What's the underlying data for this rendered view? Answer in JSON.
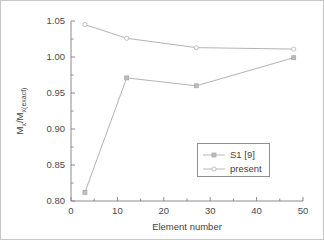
{
  "chart_data": {
    "type": "line",
    "title": "",
    "xlabel": "Element number",
    "ylabel": "Mx/Mx(exact)",
    "ylabel_parts": {
      "m1": "M",
      "sub1": "x",
      "slash": "/M",
      "sub2": "x(exact)"
    },
    "xlim": [
      0,
      50
    ],
    "ylim": [
      0.8,
      1.05
    ],
    "grid": false,
    "legend_position": "center-right",
    "x_ticks": [
      0,
      10,
      20,
      30,
      40,
      50
    ],
    "x_tick_labels": [
      "0",
      "10",
      "20",
      "30",
      "40",
      "50"
    ],
    "x_minor_ticks": [
      5,
      15,
      25,
      35,
      45
    ],
    "y_ticks": [
      0.8,
      0.85,
      0.9,
      0.95,
      1.0,
      1.05
    ],
    "y_tick_labels": [
      "0.80",
      "0.85",
      "0.90",
      "0.95",
      "1.00",
      "1.05"
    ],
    "y_minor_ticks": [
      0.825,
      0.875,
      0.925,
      0.975,
      1.025
    ],
    "series": [
      {
        "name": "S1 [9]",
        "marker": "filled-square",
        "color": "#b4b4b4",
        "x": [
          3,
          12,
          27,
          48
        ],
        "values": [
          0.812,
          0.971,
          0.96,
          0.999
        ]
      },
      {
        "name": "present",
        "marker": "open-circle",
        "color": "#b4b4b4",
        "x": [
          3,
          12,
          27,
          48
        ],
        "values": [
          1.045,
          1.026,
          1.013,
          1.011
        ]
      }
    ]
  },
  "legend": {
    "entries": [
      {
        "label": "S1 [9]",
        "marker": "filled-square"
      },
      {
        "label": "present",
        "marker": "open-circle"
      }
    ]
  }
}
